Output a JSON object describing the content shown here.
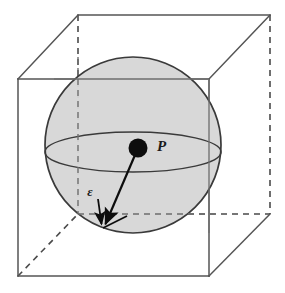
{
  "figure": {
    "type": "geometric-diagram",
    "width": 285,
    "height": 293,
    "background_color": "#ffffff"
  },
  "labels": {
    "point_label": "P",
    "epsilon_label": "ε"
  },
  "colors": {
    "sphere_fill": "#d6d6d6",
    "sphere_stroke": "#3a3a3a",
    "cube_stroke": "#555555",
    "dashed_stroke": "#4a4a4a",
    "point_fill": "#0d0d0d",
    "arrow_stroke": "#0d0d0d",
    "text_fill": "#1a1a1a"
  },
  "geometry": {
    "cube": {
      "front_face": {
        "x1": 18,
        "y1": 79,
        "x2": 209,
        "y2": 276
      },
      "back_face": {
        "x1": 78,
        "y1": 15,
        "x2": 270,
        "y2": 214
      },
      "front_top_left": [
        18,
        79
      ],
      "front_top_right": [
        209,
        79
      ],
      "front_bottom_left": [
        18,
        276
      ],
      "front_bottom_right": [
        209,
        276
      ],
      "back_top_left": [
        78,
        15
      ],
      "back_top_right": [
        270,
        15
      ],
      "back_bottom_left": [
        78,
        214
      ],
      "back_bottom_right": [
        270,
        214
      ]
    },
    "sphere": {
      "center": [
        133,
        145
      ],
      "radius": 88
    },
    "equator": {
      "center": [
        133,
        152
      ],
      "rx": 88,
      "ry": 20
    },
    "point_p": {
      "center": [
        138,
        148
      ],
      "radius": 9
    },
    "arrow": {
      "from": [
        138,
        148
      ],
      "to": [
        103,
        228
      ]
    },
    "epsilon_tick": {
      "from": [
        99,
        200
      ],
      "to": [
        101,
        226
      ]
    },
    "epsilon_label_pos": [
      90,
      195
    ],
    "point_label_pos": [
      157,
      146
    ]
  }
}
